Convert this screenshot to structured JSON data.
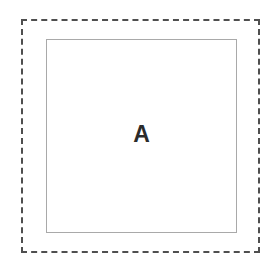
{
  "canvas": {
    "width": 274,
    "height": 263,
    "background_color": "#ffffff"
  },
  "diagram": {
    "type": "nested-rectangles",
    "outer_boundary": {
      "name": "outer dashed boundary",
      "shape": "rectangle",
      "stroke_style": "dashed",
      "stroke_color": "#4f4f4f",
      "stroke_width": 2,
      "fill": "none",
      "x": 21,
      "y": 19,
      "width": 239,
      "height": 234,
      "label": ""
    },
    "inner_square": {
      "name": "inner solid square",
      "shape": "rectangle",
      "stroke_style": "solid",
      "stroke_color": "#a9a9a9",
      "stroke_width": 1,
      "fill": "#ffffff",
      "x": 46,
      "y": 39,
      "width": 191,
      "height": 194,
      "label": "A"
    }
  }
}
